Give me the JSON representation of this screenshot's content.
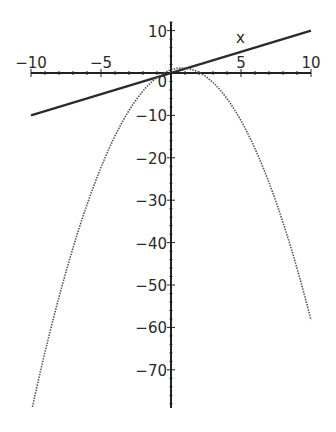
{
  "chart_data": {
    "type": "line",
    "title": "",
    "xlabel": "x",
    "ylabel": "",
    "xlim": [
      -10,
      10
    ],
    "ylim": [
      -79,
      12
    ],
    "grid": false,
    "legend": null,
    "x_ticks": [
      -10,
      -5,
      0,
      5,
      10
    ],
    "x_tick_labels": [
      "−10",
      "−5",
      "",
      "5",
      "10"
    ],
    "y_ticks": [
      10,
      0,
      -10,
      -20,
      -30,
      -40,
      -50,
      -60,
      -70
    ],
    "y_tick_labels": [
      "10",
      "0",
      "−10",
      "−20",
      "−30",
      "−40",
      "−50",
      "−60",
      "−70"
    ],
    "series": [
      {
        "name": "line",
        "style": "solid",
        "color": "#2a2a2a",
        "x": [
          -10,
          10
        ],
        "y": [
          -10,
          10
        ]
      },
      {
        "name": "parabola",
        "style": "dotted",
        "color": "#555555",
        "x": [
          -9.9,
          -8,
          -6,
          -4,
          -2,
          -0.5,
          0,
          0.8,
          2,
          4,
          6,
          8,
          10
        ],
        "y": [
          -78.7,
          -52.9,
          -31.1,
          -14.9,
          -4.25,
          0,
          0.75,
          1.18,
          0.15,
          -6.05,
          -17.85,
          -35.25,
          -58.25
        ]
      }
    ]
  },
  "plot": {
    "origin_px": [
      171,
      73
    ],
    "px_per_unit_x": 14,
    "px_per_unit_y": 4.24,
    "axis_color": "#222222",
    "line_color": "#2a2a2a",
    "curve_color": "#555555"
  }
}
